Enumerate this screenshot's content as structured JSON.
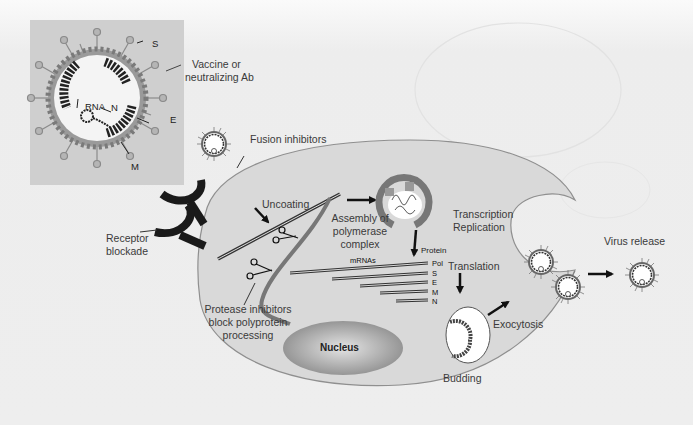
{
  "figure": {
    "type": "biological process diagram",
    "colors": {
      "background": "#f1f1f1",
      "inset_background": "#cfcfcf",
      "cell_fill": "#d9d9d9",
      "cell_outline": "#8a8a8a",
      "receptor": "#1a1a1a",
      "nucleus": "#9a9a9a",
      "text": "#3a3a3a"
    }
  },
  "inset": {
    "labels": {
      "S": "S",
      "N": "N",
      "RNA": "RNA",
      "E": "E",
      "M": "M"
    }
  },
  "labels": {
    "vaccine": [
      "Vaccine or",
      "neutralizing Ab"
    ],
    "fusion_inhibitors": "Fusion inhibitors",
    "uncoating": "Uncoating",
    "receptor_blockade": [
      "Receptor",
      "blockade"
    ],
    "assembly": [
      "Assembly of",
      "polymerase",
      "complex"
    ],
    "transcription": [
      "Transcription",
      "Replication"
    ],
    "protein_header": "Protein",
    "mrnas": "mRNAs",
    "proteins": [
      "Pol",
      "S",
      "E",
      "M",
      "N"
    ],
    "protease": [
      "Protease inhibitors",
      "block polyprotein",
      "processing"
    ],
    "nucleus": "Nucleus",
    "translation": "Translation",
    "budding": "Budding",
    "exocytosis": "Exocytosis",
    "virus_release": "Virus release"
  },
  "icons": {
    "receptor": "receptor-y-icon",
    "scissors": "scissors-icon",
    "arrow": "arrow-icon",
    "virion": "virion-icon"
  }
}
